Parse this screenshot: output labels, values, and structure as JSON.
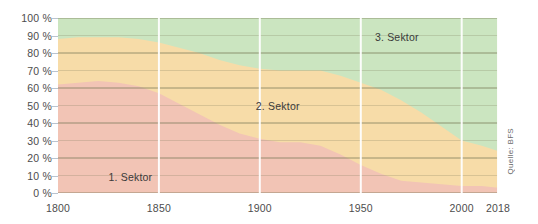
{
  "chart_data": {
    "type": "area",
    "stacked": true,
    "title": "",
    "subtitle": "",
    "xlabel": "",
    "ylabel": "",
    "xlim": [
      1800,
      2018
    ],
    "ylim": [
      0,
      100
    ],
    "grid": true,
    "legend_position": "inline-annotations",
    "source": "Quelle: BFS",
    "y_ticks": [
      "0 %",
      "10 %",
      "20 %",
      "30 %",
      "40 %",
      "50 %",
      "60 %",
      "70 %",
      "80 %",
      "90 %",
      "100 %"
    ],
    "y_tick_values": [
      0,
      10,
      20,
      30,
      40,
      50,
      60,
      70,
      80,
      90,
      100
    ],
    "x_ticks": [
      "1800",
      "1850",
      "1900",
      "1950",
      "2000",
      "2018"
    ],
    "x_tick_values": [
      1800,
      1850,
      1900,
      1950,
      2000,
      2018
    ],
    "colors": {
      "sector1": "#f2c4b5",
      "sector2": "#f7dca8",
      "sector3": "#cbe5c0",
      "gridline": "#7a7a5a",
      "vertical_gridline": "#ffffff",
      "axis_text": "#4d4d4d"
    },
    "annotations": [
      {
        "text": "1. Sektor",
        "x": 1825,
        "y": 9
      },
      {
        "text": "2. Sektor",
        "x": 1898,
        "y": 50
      },
      {
        "text": "3. Sektor",
        "x": 1957,
        "y": 89
      }
    ],
    "x": [
      1800,
      1810,
      1820,
      1830,
      1840,
      1850,
      1860,
      1870,
      1880,
      1890,
      1900,
      1910,
      1920,
      1930,
      1940,
      1950,
      1960,
      1970,
      1980,
      1990,
      2000,
      2010,
      2018
    ],
    "series": [
      {
        "name": "1. Sektor",
        "values": [
          62,
          63,
          64,
          63,
          61,
          57,
          51,
          45,
          39,
          34,
          31,
          29,
          29,
          27,
          22,
          16,
          11,
          7,
          6,
          5,
          4,
          4,
          3
        ]
      },
      {
        "name": "2. Sektor",
        "values": [
          26,
          26,
          25,
          26,
          27,
          29,
          32,
          35,
          37,
          39,
          40,
          41,
          41,
          43,
          45,
          47,
          48,
          46,
          40,
          33,
          26,
          23,
          21
        ]
      },
      {
        "name": "3. Sektor",
        "values": [
          12,
          11,
          11,
          11,
          12,
          14,
          17,
          20,
          24,
          27,
          29,
          30,
          30,
          30,
          33,
          37,
          41,
          47,
          54,
          62,
          70,
          73,
          76
        ]
      }
    ],
    "cumulative_sector1_top": [
      62,
      63,
      64,
      63,
      61,
      57,
      51,
      45,
      39,
      34,
      31,
      29,
      29,
      27,
      22,
      16,
      11,
      7,
      6,
      5,
      4,
      4,
      3
    ],
    "cumulative_sector2_top": [
      88,
      89,
      89,
      89,
      88,
      86,
      83,
      80,
      76,
      73,
      71,
      70,
      70,
      70,
      67,
      63,
      59,
      53,
      46,
      38,
      30,
      27,
      24
    ]
  },
  "source_note": {
    "text": "Quelle: BFS"
  }
}
